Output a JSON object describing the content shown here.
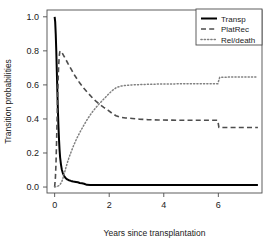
{
  "chart_data": {
    "type": "line",
    "title": "",
    "xlabel": "Years since transplantation",
    "ylabel": "Transition probabilities",
    "xlim": [
      -0.28,
      7.6
    ],
    "ylim": [
      -0.035,
      1.04
    ],
    "xticks": [
      "0",
      "2",
      "4",
      "6"
    ],
    "xtick_values": [
      0,
      2,
      4,
      6
    ],
    "yticks": [
      "0.0",
      "0.2",
      "0.4",
      "0.6",
      "0.8",
      "1.0"
    ],
    "ytick_values": [
      0.0,
      0.2,
      0.4,
      0.6,
      0.8,
      1.0
    ],
    "grid": false,
    "legend_position": "top-right",
    "series": [
      {
        "name": "Transp",
        "linestyle": "solid",
        "color": "#000000",
        "width": 2.0,
        "points": [
          [
            0.0,
            1.0
          ],
          [
            0.02,
            0.97
          ],
          [
            0.04,
            0.9
          ],
          [
            0.06,
            0.8
          ],
          [
            0.08,
            0.68
          ],
          [
            0.1,
            0.56
          ],
          [
            0.12,
            0.45
          ],
          [
            0.14,
            0.355
          ],
          [
            0.16,
            0.28
          ],
          [
            0.18,
            0.22
          ],
          [
            0.2,
            0.175
          ],
          [
            0.23,
            0.135
          ],
          [
            0.26,
            0.105
          ],
          [
            0.3,
            0.082
          ],
          [
            0.35,
            0.065
          ],
          [
            0.4,
            0.053
          ],
          [
            0.46,
            0.045
          ],
          [
            0.52,
            0.04
          ],
          [
            0.6,
            0.036
          ],
          [
            0.68,
            0.033
          ],
          [
            0.78,
            0.03
          ],
          [
            0.85,
            0.028
          ],
          [
            0.92,
            0.024
          ],
          [
            1.0,
            0.022
          ],
          [
            1.08,
            0.019
          ],
          [
            1.18,
            0.013
          ],
          [
            1.3,
            0.012
          ],
          [
            1.6,
            0.012
          ],
          [
            2.2,
            0.012
          ],
          [
            3.0,
            0.012
          ],
          [
            4.0,
            0.012
          ],
          [
            5.0,
            0.012
          ],
          [
            6.0,
            0.012
          ],
          [
            6.6,
            0.012
          ],
          [
            7.45,
            0.012
          ]
        ]
      },
      {
        "name": "PlatRec",
        "linestyle": "dashed",
        "color": "#4d4d4d",
        "width": 1.6,
        "points": [
          [
            0.0,
            0.0
          ],
          [
            0.03,
            0.06
          ],
          [
            0.05,
            0.14
          ],
          [
            0.07,
            0.26
          ],
          [
            0.09,
            0.4
          ],
          [
            0.11,
            0.53
          ],
          [
            0.13,
            0.64
          ],
          [
            0.15,
            0.72
          ],
          [
            0.17,
            0.77
          ],
          [
            0.19,
            0.795
          ],
          [
            0.22,
            0.8
          ],
          [
            0.26,
            0.793
          ],
          [
            0.32,
            0.775
          ],
          [
            0.4,
            0.752
          ],
          [
            0.5,
            0.722
          ],
          [
            0.62,
            0.688
          ],
          [
            0.75,
            0.652
          ],
          [
            0.9,
            0.616
          ],
          [
            1.05,
            0.584
          ],
          [
            1.2,
            0.556
          ],
          [
            1.35,
            0.53
          ],
          [
            1.5,
            0.506
          ],
          [
            1.65,
            0.486
          ],
          [
            1.8,
            0.468
          ],
          [
            1.95,
            0.452
          ],
          [
            2.1,
            0.434
          ],
          [
            2.25,
            0.419
          ],
          [
            2.4,
            0.41
          ],
          [
            2.6,
            0.406
          ],
          [
            2.85,
            0.403
          ],
          [
            3.1,
            0.399
          ],
          [
            3.4,
            0.396
          ],
          [
            3.8,
            0.394
          ],
          [
            4.3,
            0.393
          ],
          [
            4.9,
            0.392
          ],
          [
            5.5,
            0.392
          ],
          [
            5.98,
            0.392
          ],
          [
            6.02,
            0.35
          ],
          [
            6.5,
            0.35
          ],
          [
            7.0,
            0.35
          ],
          [
            7.45,
            0.35
          ]
        ]
      },
      {
        "name": "Rel/death",
        "linestyle": "dotted",
        "color": "#808080",
        "width": 1.5,
        "points": [
          [
            0.0,
            0.0
          ],
          [
            0.1,
            0.004
          ],
          [
            0.18,
            0.01
          ],
          [
            0.26,
            0.03
          ],
          [
            0.32,
            0.06
          ],
          [
            0.38,
            0.095
          ],
          [
            0.45,
            0.135
          ],
          [
            0.52,
            0.17
          ],
          [
            0.6,
            0.205
          ],
          [
            0.7,
            0.245
          ],
          [
            0.8,
            0.282
          ],
          [
            0.92,
            0.32
          ],
          [
            1.04,
            0.355
          ],
          [
            1.16,
            0.388
          ],
          [
            1.28,
            0.418
          ],
          [
            1.4,
            0.445
          ],
          [
            1.52,
            0.468
          ],
          [
            1.64,
            0.49
          ],
          [
            1.76,
            0.51
          ],
          [
            1.88,
            0.53
          ],
          [
            2.0,
            0.55
          ],
          [
            2.12,
            0.568
          ],
          [
            2.25,
            0.583
          ],
          [
            2.4,
            0.592
          ],
          [
            2.6,
            0.597
          ],
          [
            2.85,
            0.6
          ],
          [
            3.15,
            0.602
          ],
          [
            3.5,
            0.604
          ],
          [
            3.9,
            0.605
          ],
          [
            4.4,
            0.606
          ],
          [
            5.0,
            0.607
          ],
          [
            5.6,
            0.607
          ],
          [
            5.98,
            0.607
          ],
          [
            6.05,
            0.645
          ],
          [
            6.5,
            0.646
          ],
          [
            7.0,
            0.646
          ],
          [
            7.45,
            0.646
          ]
        ]
      }
    ],
    "legend": [
      {
        "label": "Transp",
        "linestyle": "solid",
        "color": "#000000"
      },
      {
        "label": "PlatRec",
        "linestyle": "dashed",
        "color": "#4d4d4d"
      },
      {
        "label": "Rel/death",
        "linestyle": "dotted",
        "color": "#808080"
      }
    ]
  }
}
